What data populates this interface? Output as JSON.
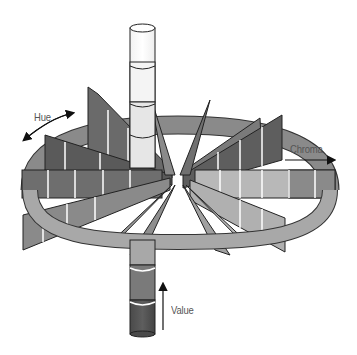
{
  "diagram": {
    "labels": {
      "hue": "Hue",
      "chroma": "Chroma",
      "value": "Value"
    },
    "axes": {
      "hue": {
        "label": "Hue",
        "direction": "circular, double-headed arrow"
      },
      "chroma": {
        "label": "Chroma",
        "direction": "outward, right-pointing arrow"
      },
      "value": {
        "label": "Value",
        "direction": "upward arrow"
      }
    },
    "value_column": {
      "segments_top_to_bottom": [
        "#ffffff",
        "#f6f6f6",
        "#e9e9e9",
        "#d9d9d9",
        "#9a9a9a",
        "#6a6a6a",
        "#4a4a4a"
      ]
    },
    "hue_ring": {
      "color": "#a8a8a8"
    },
    "chroma_spokes": {
      "count": 10,
      "palette": [
        "#5c5c5c",
        "#6e6e6e",
        "#808080",
        "#9a9a9a",
        "#b4b4b4",
        "#c8c8c8"
      ]
    }
  }
}
